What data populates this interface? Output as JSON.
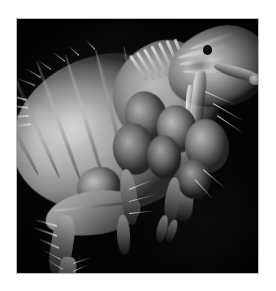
{
  "page": {
    "background_color": "#ffffff",
    "width": 276,
    "height": 291
  },
  "figure": {
    "kind": "sem-micrograph",
    "view": "lateral",
    "border_color": "#b9b9b9",
    "background_color": "#000000",
    "frame": {
      "left": 16,
      "top": 18,
      "width": 243,
      "height": 256
    },
    "caption": "",
    "scale_bar": "",
    "label_overlays": []
  },
  "micrograph": {
    "color_mode": "grayscale",
    "highlight_color": "#d2d2d2",
    "midtone_color": "#8a8a8a",
    "shadow_color": "#1a1a1a",
    "background_color": "#040404",
    "anatomy": [
      {
        "name": "abdomen",
        "tone": "bright",
        "note": "large segmented body, upper-left"
      },
      {
        "name": "thorax",
        "tone": "mid",
        "note": "segmented plates, centre"
      },
      {
        "name": "head",
        "tone": "bright",
        "note": "upper-right, rounded"
      },
      {
        "name": "eye",
        "tone": "black-spot",
        "note": "dark ocellus on head"
      },
      {
        "name": "maxillary-palp",
        "tone": "bright",
        "note": "curved appendage to the right"
      },
      {
        "name": "mouthparts-stylet",
        "tone": "bright",
        "note": "vertical bladed stylets below head"
      },
      {
        "name": "foreleg",
        "tone": "mid"
      },
      {
        "name": "midleg",
        "tone": "mid"
      },
      {
        "name": "hindleg-femur",
        "tone": "mid",
        "note": "enlarged jumping femur, lower-left"
      },
      {
        "name": "hindleg-tibia",
        "tone": "mid"
      },
      {
        "name": "hindleg-tarsus",
        "tone": "dark",
        "note": "bristled terminal segment"
      },
      {
        "name": "setae",
        "tone": "bright",
        "note": "bristles along abdomen and legs"
      }
    ]
  }
}
